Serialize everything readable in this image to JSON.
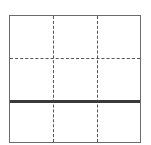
{
  "diagram": {
    "type": "grid",
    "rows": 3,
    "columns": 3,
    "frame_color": "#6b6b6b",
    "dashed_line_color": "#555555",
    "bold_line_color": "#3a3a3a",
    "vertical_dividers": [
      {
        "position_px": 43,
        "style": "dashed"
      },
      {
        "position_px": 87,
        "style": "dashed"
      }
    ],
    "horizontal_dividers": [
      {
        "position_px": 42,
        "style": "dashed"
      },
      {
        "position_px": 84,
        "style": "bold"
      }
    ]
  }
}
